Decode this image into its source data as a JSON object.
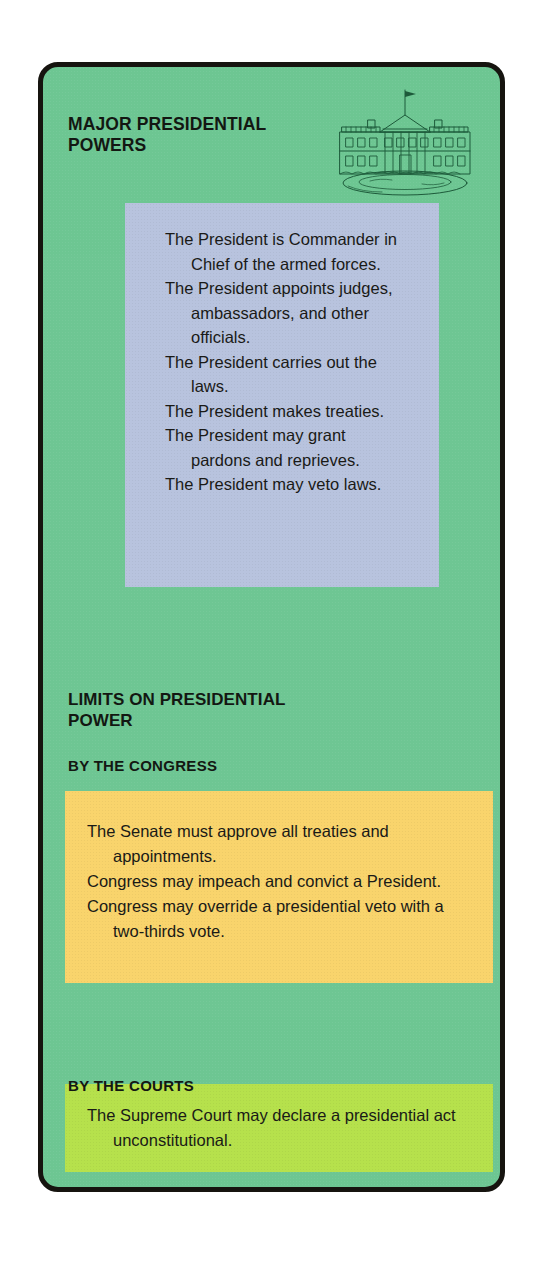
{
  "card": {
    "title": "MAJOR PRESIDENTIAL\nPOWERS",
    "background_color": "#6ec693",
    "border_color": "#16140f"
  },
  "illustration": {
    "name": "white-house-line-drawing",
    "ink_color": "#1d5a3a"
  },
  "powers": {
    "box_color": "#b8c3de",
    "items": [
      "The President is Commander in Chief of the armed forces.",
      "The President appoints judges, ambassadors, and other officials.",
      "The President carries out the laws.",
      "The President makes treaties.",
      "The President may grant pardons and reprieves.",
      "The President may veto laws."
    ]
  },
  "limits": {
    "heading": "LIMITS ON PRESIDENTIAL\nPOWER",
    "congress": {
      "subheading": "BY THE CONGRESS",
      "box_color": "#f9d46c",
      "items": [
        "The Senate must approve all treaties and appointments.",
        "Congress may impeach and convict a President.",
        "Congress may override a presidential veto with a two-thirds vote."
      ]
    },
    "courts": {
      "subheading": "BY THE COURTS",
      "box_color": "#b6e14c",
      "items": [
        "The Supreme Court may declare a presidential act unconstitutional."
      ]
    }
  }
}
